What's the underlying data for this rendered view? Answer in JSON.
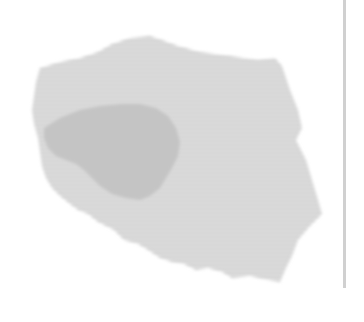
{
  "map": {
    "country": "Poland",
    "highlighted_region": "Greater Poland (Wielkopolska)",
    "colors": {
      "background": "#ffffff",
      "stripe_dark": "#c9c9c9",
      "stripe_light": "#e6e6e6",
      "highlight_fill": "#c4c4c4",
      "divider": "#d0d0d0"
    }
  },
  "divider": {
    "orientation": "vertical"
  }
}
